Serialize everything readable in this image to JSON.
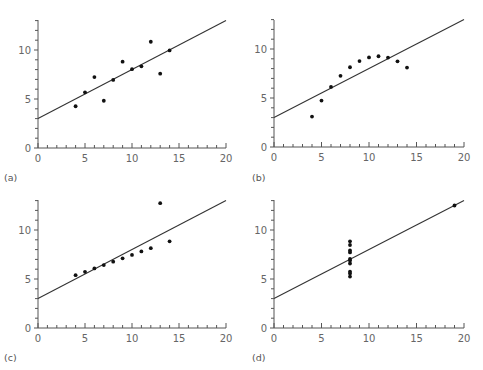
{
  "chart_data": [
    {
      "type": "scatter",
      "label": "(a)",
      "x": [
        10,
        8,
        13,
        9,
        11,
        14,
        6,
        4,
        12,
        7,
        5
      ],
      "y": [
        8.04,
        6.95,
        7.58,
        8.81,
        8.33,
        9.96,
        7.24,
        4.26,
        10.84,
        4.82,
        5.68
      ],
      "fit_line": {
        "intercept": 3,
        "slope": 0.5
      },
      "xlim": [
        0,
        20
      ],
      "ylim": [
        0,
        13
      ],
      "xticks": [
        0,
        5,
        10,
        15,
        20
      ],
      "yticks": [
        0,
        5,
        10
      ],
      "grid": false
    },
    {
      "type": "scatter",
      "label": "(b)",
      "x": [
        10,
        8,
        13,
        9,
        11,
        14,
        6,
        4,
        12,
        7,
        5
      ],
      "y": [
        9.14,
        8.14,
        8.74,
        8.77,
        9.26,
        8.1,
        6.13,
        3.1,
        9.13,
        7.26,
        4.74
      ],
      "fit_line": {
        "intercept": 3,
        "slope": 0.5
      },
      "xlim": [
        0,
        20
      ],
      "ylim": [
        0,
        13
      ],
      "xticks": [
        0,
        5,
        10,
        15,
        20
      ],
      "yticks": [
        0,
        5,
        10
      ],
      "grid": false
    },
    {
      "type": "scatter",
      "label": "(c)",
      "x": [
        10,
        8,
        13,
        9,
        11,
        14,
        6,
        4,
        12,
        7,
        5
      ],
      "y": [
        7.46,
        6.77,
        12.74,
        7.11,
        7.81,
        8.84,
        6.08,
        5.39,
        8.15,
        6.42,
        5.73
      ],
      "fit_line": {
        "intercept": 3,
        "slope": 0.5
      },
      "xlim": [
        0,
        20
      ],
      "ylim": [
        0,
        13
      ],
      "xticks": [
        0,
        5,
        10,
        15,
        20
      ],
      "yticks": [
        0,
        5,
        10
      ],
      "grid": false
    },
    {
      "type": "scatter",
      "label": "(d)",
      "x": [
        8,
        8,
        8,
        8,
        8,
        8,
        8,
        19,
        8,
        8,
        8
      ],
      "y": [
        6.58,
        5.76,
        7.71,
        8.84,
        8.47,
        7.04,
        5.25,
        12.5,
        5.56,
        7.91,
        6.89
      ],
      "fit_line": {
        "intercept": 3,
        "slope": 0.5
      },
      "xlim": [
        0,
        20
      ],
      "ylim": [
        0,
        13
      ],
      "xticks": [
        0,
        5,
        10,
        15,
        20
      ],
      "yticks": [
        0,
        5,
        10
      ],
      "grid": false
    }
  ],
  "panels_layout": [
    {
      "ox": 38,
      "oy": 148,
      "xs": 9.4,
      "ys": 9.8,
      "top": 20,
      "label_x": 4,
      "label_y": 181
    },
    {
      "ox": 274,
      "oy": 147,
      "xs": 9.5,
      "ys": 9.8,
      "top": 20,
      "label_x": 252,
      "label_y": 181
    },
    {
      "ox": 38,
      "oy": 328,
      "xs": 9.4,
      "ys": 9.8,
      "top": 200,
      "label_x": 4,
      "label_y": 361
    },
    {
      "ox": 274,
      "oy": 328,
      "xs": 9.5,
      "ys": 9.8,
      "top": 200,
      "label_x": 252,
      "label_y": 361
    }
  ]
}
